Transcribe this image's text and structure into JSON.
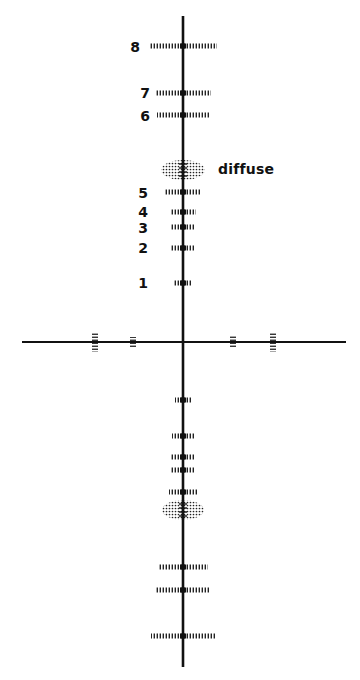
{
  "diagram": {
    "type": "spectral-line-pattern",
    "background": "#ffffff",
    "ink_color": "#111111",
    "vertical_axis": {
      "x": 183,
      "y_top": 16,
      "y_bottom": 667
    },
    "horizontal_axis": {
      "y": 342,
      "x_left": 22,
      "x_right": 346
    },
    "labels": {
      "n8": "8",
      "n7": "7",
      "n6": "6",
      "n5": "5",
      "n4": "4",
      "n3": "3",
      "n2": "2",
      "n1": "1",
      "diffuse": "diffuse"
    },
    "upper_rows": [
      {
        "label": "8",
        "y": 46,
        "half_width": 34
      },
      {
        "label": "7",
        "y": 93,
        "half_width": 28
      },
      {
        "label": "6",
        "y": 115,
        "half_width": 26
      },
      {
        "label": "5",
        "y": 192,
        "half_width": 18
      },
      {
        "label": "4",
        "y": 212,
        "half_width": 13
      },
      {
        "label": "3",
        "y": 227,
        "half_width": 12
      },
      {
        "label": "2",
        "y": 248,
        "half_width": 12
      },
      {
        "label": "1",
        "y": 283,
        "half_width": 9
      }
    ],
    "upper_diffuse": {
      "y": 170,
      "rx": 22,
      "ry": 10
    },
    "lower_rows": [
      {
        "y": 400,
        "half_width": 8
      },
      {
        "y": 436,
        "half_width": 11
      },
      {
        "y": 457,
        "half_width": 12
      },
      {
        "y": 470,
        "half_width": 12
      },
      {
        "y": 492,
        "half_width": 14
      },
      {
        "y": 567,
        "half_width": 25
      },
      {
        "y": 590,
        "half_width": 27
      },
      {
        "y": 636,
        "half_width": 32
      }
    ],
    "lower_diffuse": {
      "y": 510,
      "rx": 21,
      "ry": 10
    },
    "horizontal_ticks": [
      {
        "x": 95,
        "half_height": 10
      },
      {
        "x": 133,
        "half_height": 5
      },
      {
        "x": 233,
        "half_height": 6
      },
      {
        "x": 273,
        "half_height": 10
      }
    ]
  }
}
